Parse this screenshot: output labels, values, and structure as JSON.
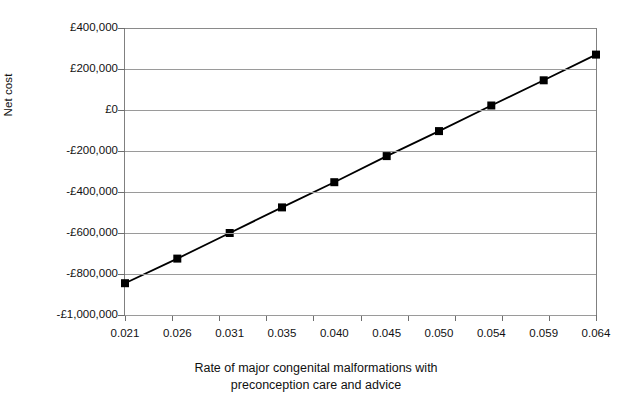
{
  "chart_data": {
    "type": "line",
    "title": "",
    "xlabel": "Rate of major congenital malformations with preconception care and advice",
    "ylabel": "Net cost",
    "categories": [
      "0.021",
      "0.026",
      "0.031",
      "0.035",
      "0.040",
      "0.045",
      "0.050",
      "0.054",
      "0.059",
      "0.064"
    ],
    "x_values": [
      0.021,
      0.026,
      0.031,
      0.035,
      0.04,
      0.045,
      0.05,
      0.054,
      0.059,
      0.064
    ],
    "values": [
      -845000,
      -725000,
      -600000,
      -475000,
      -352000,
      -225000,
      -103000,
      22000,
      145000,
      270000
    ],
    "series": [
      {
        "name": "Net cost",
        "values": [
          -845000,
          -725000,
          -600000,
          -475000,
          -352000,
          -225000,
          -103000,
          22000,
          145000,
          270000
        ]
      }
    ],
    "ylim": [
      -1000000,
      400000
    ],
    "ytick_values": [
      400000,
      200000,
      0,
      -200000,
      -400000,
      -600000,
      -800000,
      -1000000
    ],
    "ytick_labels": [
      "£400,000",
      "£200,000",
      "£0",
      "-£200,000",
      "-£400,000",
      "-£600,000",
      "-£800,000",
      "-£1,000,000"
    ],
    "grid": true,
    "legend": false,
    "marker": "square",
    "line_color": "#000000",
    "marker_color": "#000000",
    "grid_color": "#9a9a9a",
    "plot_background": "#ffffff"
  },
  "axis": {
    "y_title": "Net cost",
    "x_title_line1": "Rate of major congenital malformations with",
    "x_title_line2": "preconception care and advice"
  },
  "caption": {
    "partial_text": ""
  }
}
